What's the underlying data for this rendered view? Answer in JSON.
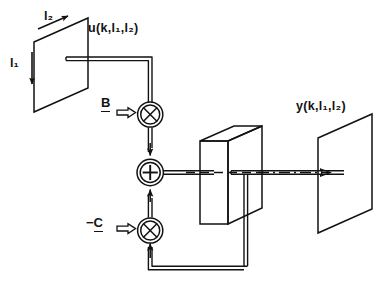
{
  "diagram": {
    "background_color": "#ffffff",
    "line_color": "#121212",
    "labels": {
      "input_signal": "u(k,l₁,l₂)",
      "output_signal": "y(k,l₁,l₂)",
      "axis_l2": "l₂",
      "axis_l1": "l₁",
      "gain_b": "B",
      "gain_c": "-C"
    },
    "nodes": [
      {
        "name": "input-plane",
        "type": "plane",
        "label": "u(k,l₁,l₂)"
      },
      {
        "name": "multiplier-b",
        "type": "multiplier",
        "symbol": "⊗",
        "gain": "B"
      },
      {
        "name": "summing-junction",
        "type": "adder",
        "symbol": "⊕"
      },
      {
        "name": "multiplier-c",
        "type": "multiplier",
        "symbol": "⊗",
        "gain": "-C"
      },
      {
        "name": "delay-block",
        "type": "box-3d"
      },
      {
        "name": "output-plane",
        "type": "plane",
        "label": "y(k,l₁,l₂)"
      }
    ],
    "connections": [
      {
        "from": "input-plane",
        "to": "multiplier-b"
      },
      {
        "from": "multiplier-b",
        "to": "summing-junction"
      },
      {
        "from": "summing-junction",
        "to": "delay-block"
      },
      {
        "from": "delay-block",
        "to": "output-plane"
      },
      {
        "from": "output-plane",
        "to": "multiplier-c",
        "kind": "feedback"
      },
      {
        "from": "multiplier-c",
        "to": "summing-junction"
      }
    ]
  }
}
